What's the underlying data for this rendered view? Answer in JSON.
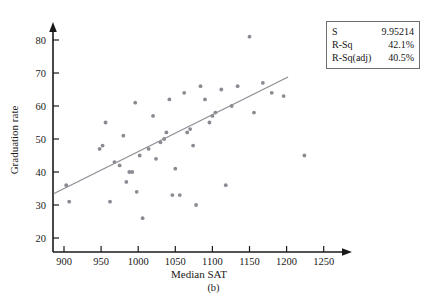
{
  "caption": "(b)",
  "legend": {
    "rows": [
      {
        "label": "S",
        "value": "9.95214"
      },
      {
        "label": "R-Sq",
        "value": "42.1%"
      },
      {
        "label": "R-Sq(adj)",
        "value": "40.5%"
      }
    ]
  },
  "colors": {
    "axis": "#1a1a1a",
    "point": "#8a8a92",
    "fit_line": "#8e8e96",
    "legend_border": "#6e6e72",
    "background": "#ffffff"
  },
  "chart_data": {
    "type": "scatter",
    "title": "",
    "xlabel": "Median SAT",
    "ylabel": "Graduation rate",
    "xlim": [
      880,
      1265
    ],
    "ylim": [
      15,
      84
    ],
    "xticks": [
      900,
      950,
      1000,
      1050,
      1100,
      1150,
      1200,
      1250
    ],
    "xticklabels": [
      "900",
      "950",
      "1000",
      "1050",
      "1100",
      "1150",
      "1200",
      "1250"
    ],
    "yticks": [
      20,
      30,
      40,
      50,
      60,
      70,
      80
    ],
    "yticklabels": [
      "20",
      "30",
      "40",
      "50",
      "60",
      "70",
      "80"
    ],
    "grid": false,
    "legend_position": "top-right",
    "points": [
      {
        "x": 903,
        "y": 36
      },
      {
        "x": 907,
        "y": 31
      },
      {
        "x": 948,
        "y": 47
      },
      {
        "x": 952,
        "y": 48
      },
      {
        "x": 956,
        "y": 55
      },
      {
        "x": 962,
        "y": 31
      },
      {
        "x": 968,
        "y": 43
      },
      {
        "x": 975,
        "y": 42
      },
      {
        "x": 980,
        "y": 51
      },
      {
        "x": 984,
        "y": 37
      },
      {
        "x": 988,
        "y": 40
      },
      {
        "x": 992,
        "y": 40
      },
      {
        "x": 996,
        "y": 61
      },
      {
        "x": 998,
        "y": 34
      },
      {
        "x": 1002,
        "y": 45
      },
      {
        "x": 1006,
        "y": 26
      },
      {
        "x": 1014,
        "y": 47
      },
      {
        "x": 1020,
        "y": 57
      },
      {
        "x": 1024,
        "y": 44
      },
      {
        "x": 1030,
        "y": 49
      },
      {
        "x": 1035,
        "y": 50
      },
      {
        "x": 1038,
        "y": 52
      },
      {
        "x": 1042,
        "y": 62
      },
      {
        "x": 1046,
        "y": 33
      },
      {
        "x": 1050,
        "y": 41
      },
      {
        "x": 1056,
        "y": 33
      },
      {
        "x": 1062,
        "y": 64
      },
      {
        "x": 1066,
        "y": 52
      },
      {
        "x": 1070,
        "y": 53
      },
      {
        "x": 1074,
        "y": 48
      },
      {
        "x": 1078,
        "y": 30
      },
      {
        "x": 1084,
        "y": 66
      },
      {
        "x": 1090,
        "y": 62
      },
      {
        "x": 1096,
        "y": 55
      },
      {
        "x": 1100,
        "y": 57
      },
      {
        "x": 1104,
        "y": 58
      },
      {
        "x": 1112,
        "y": 65
      },
      {
        "x": 1118,
        "y": 36
      },
      {
        "x": 1126,
        "y": 60
      },
      {
        "x": 1134,
        "y": 66
      },
      {
        "x": 1150,
        "y": 81
      },
      {
        "x": 1156,
        "y": 58
      },
      {
        "x": 1168,
        "y": 67
      },
      {
        "x": 1180,
        "y": 64
      },
      {
        "x": 1196,
        "y": 63
      },
      {
        "x": 1224,
        "y": 45
      }
    ],
    "fit_line": {
      "x0": 886,
      "y0": 33.4,
      "x1": 1202,
      "y1": 68.8,
      "S": "9.95214",
      "r_squared": "42.1%",
      "r_squared_adj": "40.5%"
    }
  }
}
